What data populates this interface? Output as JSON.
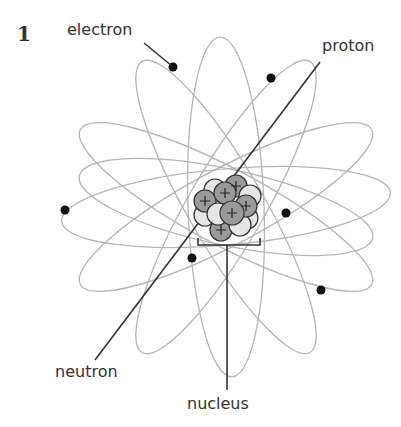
{
  "figure": {
    "number": "1",
    "labels": {
      "electron": "electron",
      "proton": "proton",
      "neutron": "neutron",
      "nucleus": "nucleus"
    },
    "nucleus_center": [
      226,
      207
    ],
    "colors": {
      "orbit": "#b5b5b5",
      "electron": "#111111",
      "proton_fill": "#9a9a9a",
      "neutron_fill": "#e6e6e6",
      "particle_stroke": "#333333",
      "leader_line": "#333333"
    },
    "particle_symbols": {
      "proton": "+"
    }
  }
}
